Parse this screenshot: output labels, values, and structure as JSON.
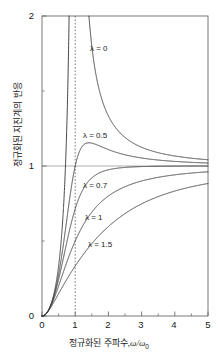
{
  "chart_data": {
    "type": "line",
    "title": "",
    "xlabel": "정규화된 주파수, ω/ω₀",
    "xlabel_text": "정규화된 주파수,",
    "xlabel_symbol": "ω",
    "xlabel_symbol2": "/ω",
    "xlabel_subscript": "0",
    "ylabel": "정규화된 지진계의 반응",
    "xlim": [
      0,
      5
    ],
    "ylim": [
      0,
      2
    ],
    "xticks": [
      "0",
      "1",
      "2",
      "3",
      "4",
      "5"
    ],
    "xtick_values": [
      0,
      1,
      2,
      3,
      4,
      5
    ],
    "yticks": [
      "0",
      "1",
      "2"
    ],
    "ytick_values": [
      0,
      1,
      2
    ],
    "y_minor_ticks": [
      0.5,
      1.5
    ],
    "x_minor_ticks": [
      0.5,
      1.5,
      2.5,
      3.5,
      4.5
    ],
    "grid": false,
    "reference_line_y": 1,
    "reference_line_x_dotted": 1,
    "legend_position": "inline-annotations",
    "series": [
      {
        "name": "λ = 0",
        "lambda": 0,
        "label": "λ = 0",
        "label_lambda": "λ",
        "label_eq": "= 0",
        "color": "#3c3c3c",
        "x": [
          0,
          0.1,
          0.2,
          0.3,
          0.4,
          0.5,
          0.6,
          0.7,
          0.8,
          0.85,
          0.9,
          0.93,
          0.95,
          0.97,
          0.98,
          0.99,
          1.01,
          1.02,
          1.03,
          1.05,
          1.08,
          1.12,
          1.2,
          1.3,
          1.4,
          1.5,
          1.7,
          2.0,
          2.5,
          3.0,
          3.5,
          4.0,
          4.5,
          5.0
        ],
        "y": [
          0,
          0.0101,
          0.0417,
          0.0989,
          0.1905,
          0.3333,
          0.5625,
          0.9608,
          1.7778,
          2.4,
          4.263,
          6.712,
          9.744,
          16.13,
          24.25,
          49.25,
          50.75,
          25.75,
          17.24,
          10.49,
          6.06,
          4.07,
          2.27,
          1.53,
          1.22,
          1.0,
          0.731,
          0.4444,
          0.2899,
          0.2051,
          0.1546,
          0.1212,
          0.0976,
          0.0803
        ],
        "formula": "r^2 / |1 - r^2|"
      },
      {
        "name": "λ = 0.5",
        "lambda": 0.5,
        "label": "λ = 0.5",
        "label_lambda": "λ",
        "label_eq": "= 0.5",
        "color": "#3c3c3c",
        "peak_x": 1.31,
        "peak_y": 1.155,
        "formula": "r^2 / sqrt((1-r^2)^2 + (2*0.5*r)^2)"
      },
      {
        "name": "λ = 0.7",
        "lambda": 0.7,
        "label": "λ = 0.7",
        "label_lambda": "λ",
        "label_eq": "= 0.7",
        "color": "#3c3c3c",
        "formula": "r^2 / sqrt((1-r^2)^2 + (2*0.7*r)^2)"
      },
      {
        "name": "λ = 1",
        "lambda": 1,
        "label": "λ = 1",
        "label_lambda": "λ",
        "label_eq": "= 1",
        "color": "#3c3c3c",
        "formula": "r^2 / sqrt((1-r^2)^2 + (2*1*r)^2)"
      },
      {
        "name": "λ = 1.5",
        "lambda": 1.5,
        "label": "λ = 1.5",
        "label_lambda": "λ",
        "label_eq": "= 1.5",
        "color": "#3c3c3c",
        "formula": "r^2 / sqrt((1-r^2)^2 + (2*1.5*r)^2)"
      }
    ],
    "annotations": [
      {
        "text": "λ = 0",
        "x": 1.45,
        "y": 1.7
      },
      {
        "text": "λ = 0.5",
        "x": 1.25,
        "y": 1.16
      },
      {
        "text": "λ = 0.7",
        "x": 1.25,
        "y": 0.83
      },
      {
        "text": "λ = 1",
        "x": 1.3,
        "y": 0.62
      },
      {
        "text": "λ = 1.5",
        "x": 1.35,
        "y": 0.4
      }
    ]
  },
  "axes": {
    "frame_color": "#6b6b6b",
    "curve_color": "#4a4a4a",
    "reference_color": "#9a9a9a"
  }
}
